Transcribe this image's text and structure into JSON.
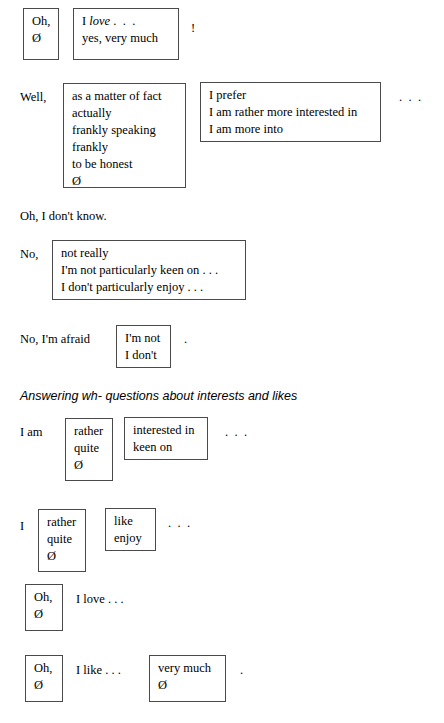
{
  "document": {
    "type": "language-function-reference-table",
    "heading": "Answering wh- questions about interests and likes",
    "rows": [
      {
        "id": "row-oh-love",
        "lead": "",
        "box1": [
          "Oh,",
          "Ø"
        ],
        "mid_text": "",
        "box2": [
          "I love . . .",
          "yes, very much"
        ],
        "box2_italic_word": "love",
        "trailing": "!"
      },
      {
        "id": "row-well",
        "lead": "Well,",
        "box1": [
          "as a matter of fact",
          "actually",
          "frankly speaking",
          "frankly",
          "to be honest",
          "Ø"
        ],
        "box2": [
          "I prefer",
          "I am rather more interested in",
          "I am more into"
        ],
        "trailing": ". . ."
      },
      {
        "id": "row-oh-i-dont-know",
        "plain_line": "Oh, I don't know."
      },
      {
        "id": "row-no",
        "lead": "No,",
        "box1": [
          "not really",
          "I'm not particularly keen on . . .",
          "I don't particularly enjoy . . ."
        ]
      },
      {
        "id": "row-no-im-afraid",
        "lead": "No, I'm afraid",
        "box1": [
          "I'm not",
          "I don't"
        ],
        "trailing": "."
      },
      {
        "id": "row-i-am",
        "lead": "I am",
        "box1": [
          "rather",
          "quite",
          "Ø"
        ],
        "box2": [
          "interested in",
          "keen on"
        ],
        "trailing": ". . ."
      },
      {
        "id": "row-i",
        "lead": "I",
        "box1": [
          "rather",
          "quite",
          "Ø"
        ],
        "box2": [
          "like",
          "enjoy"
        ],
        "trailing": ". . ."
      },
      {
        "id": "row-oh-i-love",
        "box1": [
          "Oh,",
          "Ø"
        ],
        "mid_text": "I love . . ."
      },
      {
        "id": "row-oh-i-like",
        "box1": [
          "Oh,",
          "Ø"
        ],
        "mid_text": "I like . . .",
        "box2": [
          "very much",
          "Ø"
        ],
        "trailing": "."
      }
    ]
  },
  "colors": {
    "text": "#000000",
    "border": "#4a4a4a",
    "background": "#ffffff"
  }
}
